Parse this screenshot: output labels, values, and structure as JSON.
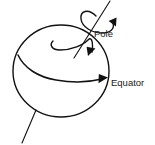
{
  "figure": {
    "background_color": "#ffffff",
    "stroke_color": "#111111",
    "text_color": "#1a1a1a",
    "width": 155,
    "height": 145
  },
  "labels": {
    "pole": "Pole",
    "equator": "Equator"
  },
  "elements": {
    "sphere_name": "sphere-outline",
    "axis_name": "rotation-axis",
    "spin_arrow_name": "spin-direction-arrow",
    "spiral_name": "spiral-flow-curve",
    "equator_curve_name": "equator-curve"
  },
  "geometry": {
    "sphere_center_x": 61,
    "sphere_center_y": 71,
    "sphere_radius_x": 48,
    "sphere_radius_y": 46,
    "axis_top_x": 110,
    "axis_top_y": 1,
    "axis_bottom_x": 22,
    "axis_bottom_y": 143
  }
}
